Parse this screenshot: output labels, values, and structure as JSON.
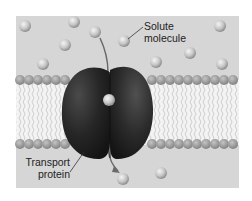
{
  "diagram": {
    "labels": {
      "solute_line1": "Solute",
      "solute_line2": "molecule",
      "transport_line1": "Transport",
      "transport_line2": "protein"
    },
    "colors": {
      "background": "#ffffff",
      "panel": "#d4d4d4",
      "lipid_head": "#9c9c9c",
      "lipid_tail": "#f2f2f2",
      "protein": "#2a2a2a",
      "solute": "#c8c8c8"
    }
  }
}
